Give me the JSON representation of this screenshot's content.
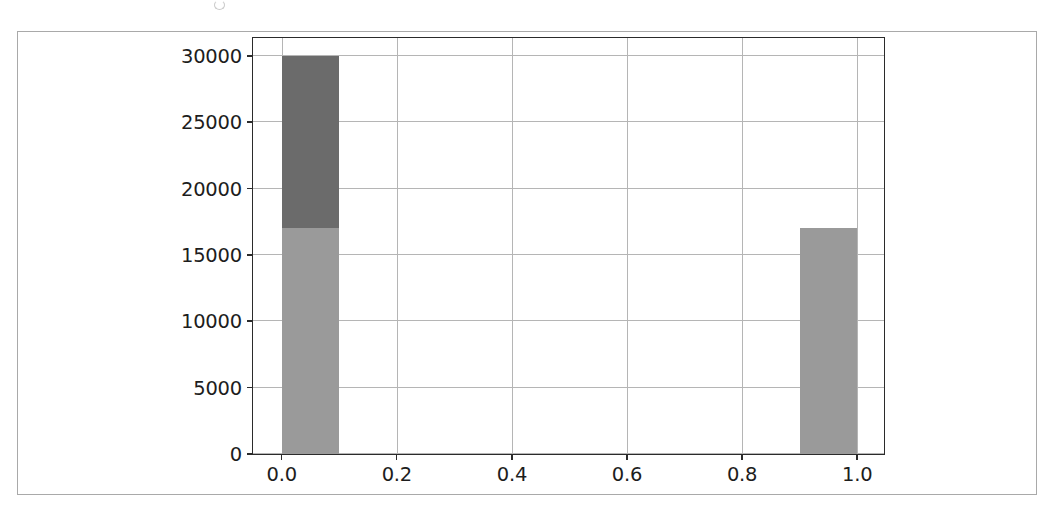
{
  "figure": {
    "background_color": "#ffffff",
    "frame_color": "#a9a9a9",
    "axes_edge_color": "#2b2b2b",
    "grid_color": "#b5b5b5"
  },
  "chart_data": {
    "type": "bar",
    "title": "",
    "subtitle": "",
    "xlabel": "",
    "ylabel": "",
    "xlim": [
      -0.05,
      1.05
    ],
    "ylim": [
      0,
      31500
    ],
    "grid": true,
    "legend_position": "none",
    "stacked": true,
    "bin_width": 0.1,
    "x": [
      0.0,
      1.0
    ],
    "categories": [
      "0.0",
      "1.0"
    ],
    "series": [
      {
        "name": "lower-segment",
        "color": "#9a9a9a",
        "values": [
          17000,
          17000
        ]
      },
      {
        "name": "upper-segment",
        "color": "#6b6b6b",
        "values": [
          13000,
          0
        ]
      }
    ],
    "bar_totals": [
      30000,
      17000
    ],
    "xticks": [
      0.0,
      0.2,
      0.4,
      0.6,
      0.8,
      1.0
    ],
    "xticklabels": [
      "0.0",
      "0.2",
      "0.4",
      "0.6",
      "0.8",
      "1.0"
    ],
    "yticks": [
      0,
      5000,
      10000,
      15000,
      20000,
      25000,
      30000
    ],
    "yticklabels": [
      "0",
      "5000",
      "10000",
      "15000",
      "20000",
      "25000",
      "30000"
    ],
    "bars": [
      {
        "name": "bar-zero",
        "x_start": 0.0,
        "x_end": 0.1,
        "segments": [
          {
            "name": "lower-segment",
            "from": 0,
            "to": 17000,
            "color": "#9a9a9a"
          },
          {
            "name": "upper-segment",
            "from": 17000,
            "to": 30000,
            "color": "#6b6b6b"
          }
        ]
      },
      {
        "name": "bar-one",
        "x_start": 0.9,
        "x_end": 1.0,
        "segments": [
          {
            "name": "lower-segment",
            "from": 0,
            "to": 17000,
            "color": "#9a9a9a"
          }
        ]
      }
    ]
  }
}
